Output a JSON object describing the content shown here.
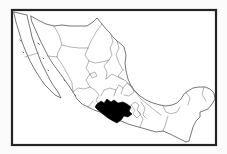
{
  "figure": {
    "kind": "locator-map",
    "country": "Mexico",
    "highlighted_region": "Michoacán"
  },
  "colors": {
    "page_background": "#fbfbfb",
    "map_background": "#ffffff",
    "land_fill": "#ffffff",
    "frame_stroke": "#242424",
    "coastline_stroke": "#4a4a4a",
    "state_border_stroke": "#767676",
    "island_stroke": "#5a5a5a",
    "highlight_fill": "#000000"
  },
  "map": {
    "paths": {
      "mainland": "M31,16 L38,20 46,24 54,26 62,25 70,26 79,26 87,26 93,22 97,18 102,24 106,29 110,33 113,37 117,41 121,44 124,47 126,55 125,63 126,71 128,79 131,86 135,91 140,96 146,100 153,103 160,105 166,106 172,105 177,103 181,99 184,94 188,91 193,88 199,87 205,87 210,89 214,93 215,99 212,104 208,109 203,111 200,112 200,117 196,121 193,127 191,134 189,141 186,142 178,138 170,134 163,131 156,132 149,130 142,128 135,126 128,124 121,121 113,120 106,116 100,112 94,110 88,107 82,104 77,99 73,92 69,86 64,79 59,72 53,64 48,56 44,48 40,40 36,31 32,22 Z",
      "baja_california": "M14,12 L27,15 28,20 30,28 32,37 35,46 38,54 41,62 45,70 49,78 53,85 58,92 61,98 55,95 50,90 45,85 40,78 35,70 30,61 26,52 22,42 19,32 16,22 Z",
      "highlight": "M97,104 L101,101 104,103 107,99 111,102 114,100 118,103 123,102 127,104 131,107 129,111 132,114 128,117 124,116 121,120 117,123 113,121 108,118 103,114 98,110 95,107 Z"
    },
    "interior_borders": [
      "M54,26 L59,35 62,45 58,52 57,57",
      "M48,56 L57,57",
      "M57,57 L63,66 68,75 72,83 73,92",
      "M102,24 L96,32 91,41 88,48",
      "M62,45 L70,47 79,48 88,48",
      "M88,48 L85,55 89,61",
      "M89,61 L95,63 102,62 109,60",
      "M109,60 L112,55 110,48 113,42 111,35",
      "M117,41 L119,48 116,55 119,63 123,70",
      "M123,70 L118,76 124,80",
      "M109,60 L104,66 107,72 106,79",
      "M106,79 L112,74 118,77 124,80",
      "M89,61 L86,68 90,74 86,80 90,87",
      "M90,74 L95,72 97,76 92,78 90,74",
      "M73,92 L78,88 84,89 90,87",
      "M90,87 L95,90 99,95 96,100 98,104",
      "M88,107 L93,101",
      "M101,96 L104,90 110,88 116,90 114,96",
      "M116,90 L119,85 123,88 121,94",
      "M123,88 L127,83 132,86 134,92 129,96 124,95",
      "M125,80 L131,87 136,93 141,99 147,104 152,108 157,112 161,115",
      "M131,105 L135,102 139,105 137,110 141,114 137,118 133,114 135,110 131,105",
      "M141,102 L145,108 143,115 146,118",
      "M138,111 L143,119 140,127",
      "M163,131 L166,123 168,116",
      "M163,106 L166,112 171,114 177,112 180,107",
      "M186,92 L190,98 188,105",
      "M204,87 L202,94 206,101",
      "M25,57 L38,53"
    ],
    "islands": [
      "M38,43 l1.4,1.6",
      "M43,58 l0.6,0.7",
      "M48,70 l0.6,0.7",
      "M64,80 l0.7,0.5",
      "M75,95 l0.7,0.5",
      "M20,40 l0.5,0.6",
      "M23,52 l0.5,0.6"
    ]
  }
}
